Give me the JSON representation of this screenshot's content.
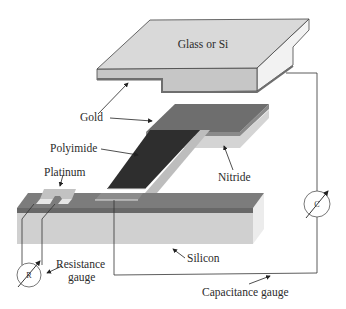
{
  "diagram": {
    "type": "exploded-layer-device",
    "labels": {
      "top_plate": "Glass or Si",
      "gold": "Gold",
      "polyimide": "Polyimide",
      "platinum": "Platinum",
      "nitride": "Nitride",
      "silicon": "Silicon",
      "resistance_gauge_line1": "Resistance",
      "resistance_gauge_line2": "gauge",
      "capacitance_gauge": "Capacitance gauge"
    },
    "meters": {
      "resistance_symbol": "R",
      "capacitance_symbol": "C"
    },
    "colors": {
      "plate_top": "#d9d9d9",
      "plate_front": "#c4c4c4",
      "plate_side": "#f0f0f0",
      "gold": "#6e6e6e",
      "gold_edge": "#8a8a8a",
      "nitride": "#d2d2d2",
      "polyimide": "#2e2e2e",
      "silicon_top": "#7a7a7a",
      "silicon_layer": "#6a6a6a",
      "silicon_front": "#cfcfcf",
      "silicon_side": "#ebebeb",
      "platinum": "#bdbdbd",
      "wire": "#333333"
    }
  }
}
